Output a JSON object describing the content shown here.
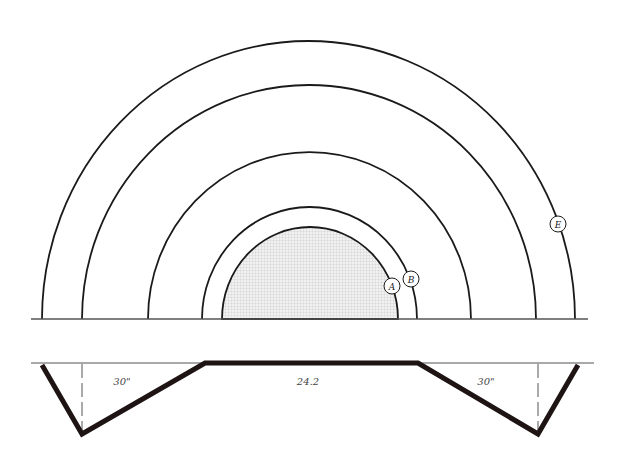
{
  "diagram": {
    "title": "",
    "colors": {
      "line": "#1a1a1a",
      "shade": "#e6e6e6",
      "ground": "#555555",
      "profile": "#1e1414"
    },
    "ground_line": {
      "y": 319,
      "x1": 31,
      "x2": 588
    },
    "arcs": [
      {
        "id": "outer",
        "cx": 308.5,
        "rx": 266.5,
        "ry": 278
      },
      {
        "id": "second",
        "cx": 309,
        "rx": 227,
        "ry": 234
      },
      {
        "id": "third",
        "cx": 309.5,
        "rx": 161.5,
        "ry": 167
      },
      {
        "id": "B",
        "cx": 309.5,
        "rx": 107.5,
        "ry": 112
      },
      {
        "id": "A-shaded",
        "cx": 310,
        "rx": 88,
        "ry": 92
      }
    ],
    "circle_labels": [
      {
        "text": "A",
        "x": 392,
        "y": 286
      },
      {
        "text": "B",
        "x": 411,
        "y": 279
      },
      {
        "text": "E",
        "x": 558,
        "y": 224
      }
    ],
    "cross_section": {
      "top_line_y": 363,
      "labels": [
        {
          "text": "30\"",
          "x": 122,
          "y": 385
        },
        {
          "text": "24.2",
          "x": 308,
          "y": 385
        },
        {
          "text": "30\"",
          "x": 486,
          "y": 385
        }
      ]
    }
  }
}
